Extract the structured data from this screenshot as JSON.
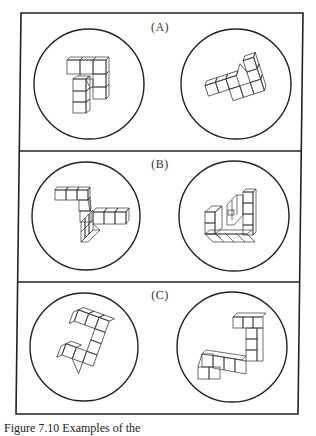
{
  "figure": {
    "panels": [
      {
        "id": "A",
        "label": "(A)",
        "label_pos": [
          160,
          22
        ],
        "circles": [
          {
            "side": "left",
            "cx": 89,
            "cy": 84,
            "r": 55
          },
          {
            "side": "right",
            "cx": 236,
            "cy": 84,
            "r": 55
          }
        ]
      },
      {
        "id": "B",
        "label": "(B)",
        "label_pos": [
          160,
          160
        ],
        "circles": [
          {
            "side": "left",
            "cx": 86,
            "cy": 216,
            "r": 54
          },
          {
            "side": "right",
            "cx": 234,
            "cy": 216,
            "r": 55
          }
        ]
      },
      {
        "id": "C",
        "label": "(C)",
        "label_pos": [
          160,
          291
        ],
        "circles": [
          {
            "side": "left",
            "cx": 84,
            "cy": 347,
            "r": 54
          },
          {
            "side": "right",
            "cx": 232,
            "cy": 347,
            "r": 55
          }
        ]
      }
    ],
    "frame": {
      "top_left": [
        21,
        13
      ],
      "top_right": [
        303,
        13
      ],
      "bottom_right": [
        298,
        414
      ],
      "bottom_left": [
        16,
        414
      ],
      "dividers_y": [
        151,
        282
      ],
      "stroke_color": "#222222"
    },
    "caption": "Figure 7.10  Examples of the"
  }
}
